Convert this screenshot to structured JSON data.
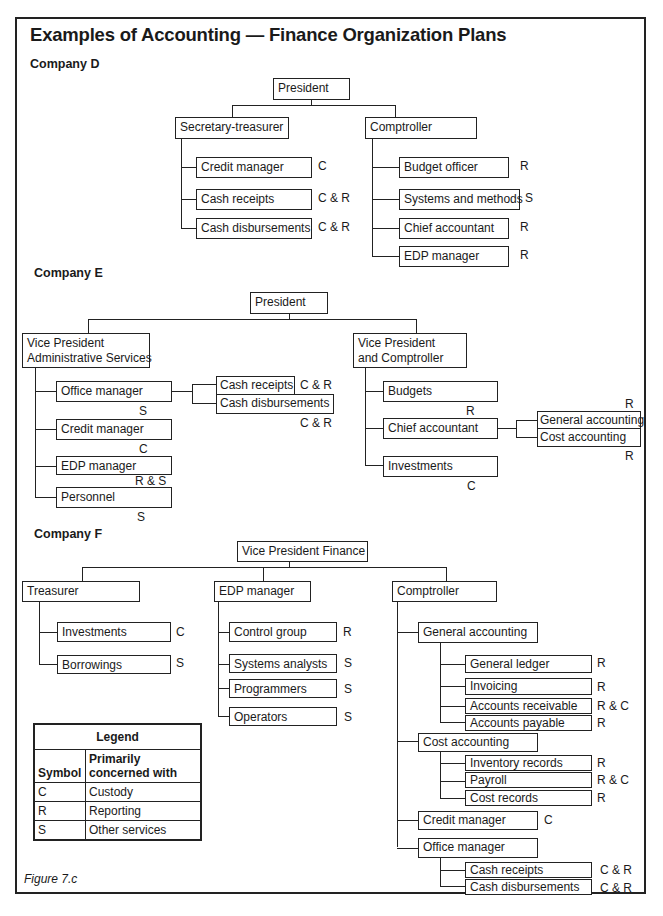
{
  "title": "Examples of Accounting — Finance Organization Plans",
  "figure_label": "Figure 7.c",
  "companies": {
    "d": {
      "label": "Company D",
      "president": "President",
      "secretary_treasurer": "Secretary-treasurer",
      "comptroller": "Comptroller",
      "left_units": [
        {
          "name": "Credit manager",
          "code": "C"
        },
        {
          "name": "Cash receipts",
          "code": "C & R"
        },
        {
          "name": "Cash disbursements",
          "code": "C & R"
        }
      ],
      "right_units": [
        {
          "name": "Budget officer",
          "code": "R"
        },
        {
          "name": "Systems and methods",
          "code": "S"
        },
        {
          "name": "Chief accountant",
          "code": "R"
        },
        {
          "name": "EDP manager",
          "code": "R"
        }
      ]
    },
    "e": {
      "label": "Company E",
      "president": "President",
      "vp_admin_line1": "Vice President",
      "vp_admin_line2": "Administrative Services",
      "vp_comp_line1": "Vice President",
      "vp_comp_line2": "and Comptroller",
      "left_units": [
        {
          "name": "Office manager",
          "code": "S"
        },
        {
          "name": "Credit manager",
          "code": "C"
        },
        {
          "name": "EDP manager",
          "code": "R & S"
        },
        {
          "name": "Personnel",
          "code": "S"
        }
      ],
      "office_sub": [
        {
          "name": "Cash receipts",
          "code": "C & R"
        },
        {
          "name": "Cash disbursements",
          "code": "C & R"
        }
      ],
      "right_units": [
        {
          "name": "Budgets",
          "code": "R"
        },
        {
          "name": "Chief accountant",
          "code": ""
        },
        {
          "name": "Investments",
          "code": "C"
        }
      ],
      "chief_sub": [
        {
          "name": "General accounting",
          "code": "R"
        },
        {
          "name": "Cost accounting",
          "code": "R"
        }
      ]
    },
    "f": {
      "label": "Company F",
      "vp_finance": "Vice President Finance",
      "treasurer": "Treasurer",
      "edp_manager": "EDP manager",
      "comptroller": "Comptroller",
      "treasurer_units": [
        {
          "name": "Investments",
          "code": "C"
        },
        {
          "name": "Borrowings",
          "code": "S"
        }
      ],
      "edp_units": [
        {
          "name": "Control group",
          "code": "R"
        },
        {
          "name": "Systems analysts",
          "code": "S"
        },
        {
          "name": "Programmers",
          "code": "S"
        },
        {
          "name": "Operators",
          "code": "S"
        }
      ],
      "comptroller_units": {
        "general_accounting": "General accounting",
        "general_sub": [
          {
            "name": "General ledger",
            "code": "R"
          },
          {
            "name": "Invoicing",
            "code": "R"
          },
          {
            "name": "Accounts receivable",
            "code": "R & C"
          },
          {
            "name": "Accounts payable",
            "code": "R"
          }
        ],
        "cost_accounting": "Cost accounting",
        "cost_sub": [
          {
            "name": "Inventory records",
            "code": "R"
          },
          {
            "name": "Payroll",
            "code": "R & C"
          },
          {
            "name": "Cost records",
            "code": "R"
          }
        ],
        "credit_manager": {
          "name": "Credit manager",
          "code": "C"
        },
        "office_manager": "Office manager",
        "office_sub": [
          {
            "name": "Cash receipts",
            "code": "C & R"
          },
          {
            "name": "Cash disbursements",
            "code": "C & R"
          }
        ]
      }
    }
  },
  "legend": {
    "title": "Legend",
    "col1": "Symbol",
    "col2_line1": "Primarily",
    "col2_line2": "concerned with",
    "rows": [
      {
        "symbol": "C",
        "meaning": "Custody"
      },
      {
        "symbol": "R",
        "meaning": "Reporting"
      },
      {
        "symbol": "S",
        "meaning": "Other services"
      }
    ]
  }
}
